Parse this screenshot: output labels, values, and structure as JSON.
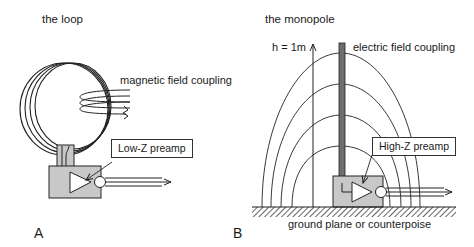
{
  "panel_a": {
    "title": "the loop",
    "letter": "A",
    "coupling_label": "magnetic field coupling",
    "preamp_label": "Low-Z preamp"
  },
  "panel_b": {
    "title": "the monopole",
    "letter": "B",
    "height_label": "h = 1m",
    "coupling_label": "electric field coupling",
    "preamp_label": "High-Z preamp",
    "ground_label": "ground plane or counterpoise"
  },
  "colors": {
    "line": "#222222",
    "box_fill": "#c8c8c8",
    "antenna_fill": "#6e6e6e",
    "background": "#ffffff"
  }
}
